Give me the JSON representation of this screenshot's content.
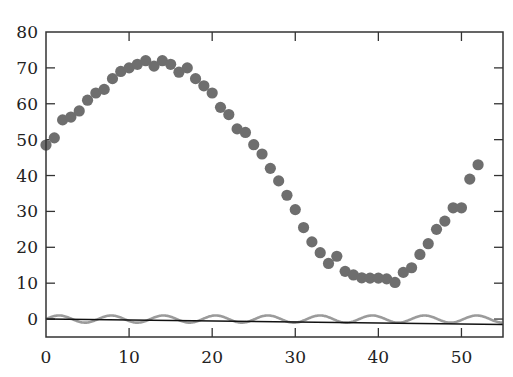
{
  "chart_data": {
    "type": "scatter",
    "title": "",
    "xlabel": "",
    "ylabel": "",
    "xlim": [
      0,
      55
    ],
    "ylim": [
      -5,
      80
    ],
    "grid": false,
    "legend": null,
    "x_ticks": [
      0,
      10,
      20,
      30,
      40,
      50
    ],
    "y_ticks": [
      0,
      10,
      20,
      30,
      40,
      50,
      60,
      70,
      80
    ],
    "series": [
      {
        "name": "data points",
        "type": "scatter",
        "color": "#6e6e6e",
        "x": [
          0,
          1,
          2,
          3,
          4,
          5,
          6,
          7,
          8,
          9,
          10,
          11,
          12,
          13,
          14,
          15,
          16,
          17,
          18,
          19,
          20,
          21,
          22,
          23,
          24,
          25,
          26,
          27,
          28,
          29,
          30,
          31,
          32,
          33,
          34,
          35,
          36,
          37,
          38,
          39,
          40,
          41,
          42,
          43,
          44,
          45,
          46,
          47,
          48,
          49,
          50,
          51,
          52
        ],
        "values": [
          48.5,
          50.5,
          55.5,
          56.3,
          58,
          61,
          63,
          64,
          67,
          69,
          70,
          71,
          72,
          70.5,
          72,
          71,
          68.8,
          70,
          67,
          65,
          63,
          59,
          57,
          53,
          52,
          48.6,
          46,
          42,
          38.5,
          34.5,
          30.5,
          25.5,
          21.5,
          18.5,
          15.5,
          17.5,
          13.3,
          12.3,
          11.5,
          11.4,
          11.4,
          11.2,
          10.2,
          13,
          14.3,
          18,
          21,
          25,
          27.3,
          31,
          31,
          39,
          43
        ]
      },
      {
        "name": "sine curve",
        "type": "line",
        "color": "#8a8a8a",
        "description": "y = sin(x), amplitude ~1, period ~2π",
        "x_range": [
          0,
          55
        ]
      },
      {
        "name": "trend line",
        "type": "line",
        "color": "#111111",
        "x": [
          0,
          55
        ],
        "values": [
          0,
          -1.5
        ]
      }
    ]
  },
  "axes": {
    "x_tick_labels": [
      "0",
      "10",
      "20",
      "30",
      "40",
      "50"
    ],
    "y_tick_labels": [
      "0",
      "10",
      "20",
      "30",
      "40",
      "50",
      "60",
      "70",
      "80"
    ]
  }
}
